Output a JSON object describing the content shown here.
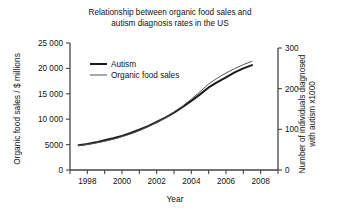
{
  "chart_data": {
    "type": "line",
    "title": "Relationship between organic food sales and\nautism diagnosis rates in the US",
    "xlabel": "Year",
    "ylabel": "Organic food sales / $ millions",
    "ylabel_right": "Number of individuals diagnosed\nwith autism x1000",
    "xlim": [
      1997,
      2009
    ],
    "ylim": [
      0,
      25000
    ],
    "ylim_right": [
      0,
      300
    ],
    "grid": false,
    "legend_position": "upper-left-inside",
    "xticks": [
      1997,
      1998,
      1999,
      2000,
      2001,
      2002,
      2003,
      2004,
      2005,
      2006,
      2007,
      2008,
      2009
    ],
    "xticklabels": [
      "",
      "1998",
      "",
      "2000",
      "",
      "2002",
      "",
      "2004",
      "",
      "2006",
      "",
      "2008",
      ""
    ],
    "yticks": [
      0,
      5000,
      10000,
      15000,
      20000,
      25000
    ],
    "yticklabels": [
      "0",
      "5000",
      "10 000",
      "15 000",
      "20 000",
      "25 000"
    ],
    "yticks_right": [
      0,
      100,
      200,
      300
    ],
    "yticklabels_right": [
      "0",
      "100",
      "200",
      "300"
    ],
    "x": [
      1997.5,
      1998,
      1998.5,
      1999,
      1999.5,
      2000,
      2000.5,
      2001,
      2001.5,
      2002,
      2002.5,
      2003,
      2003.5,
      2004,
      2004.5,
      2005,
      2005.5,
      2006,
      2006.5,
      2007,
      2007.5
    ],
    "series": [
      {
        "name": "Autism",
        "axis": "right",
        "color": "#1a1a1a",
        "linewidth": 2,
        "values": [
          61,
          64,
          68,
          73,
          78,
          84,
          91,
          99,
          108,
          118,
          129,
          141,
          155,
          170,
          186,
          203,
          216,
          228,
          240,
          250,
          258
        ]
      },
      {
        "name": "Organic food sales",
        "axis": "left",
        "color": "#555555",
        "linewidth": 1,
        "values": [
          4800,
          5020,
          5300,
          5650,
          6050,
          6550,
          7100,
          7750,
          8500,
          9350,
          10300,
          11400,
          12600,
          13950,
          15400,
          16950,
          18100,
          19100,
          19950,
          20750,
          21400
        ]
      }
    ]
  },
  "legend": {
    "items": [
      {
        "label": "Autism"
      },
      {
        "label": "Organic food sales"
      }
    ]
  }
}
